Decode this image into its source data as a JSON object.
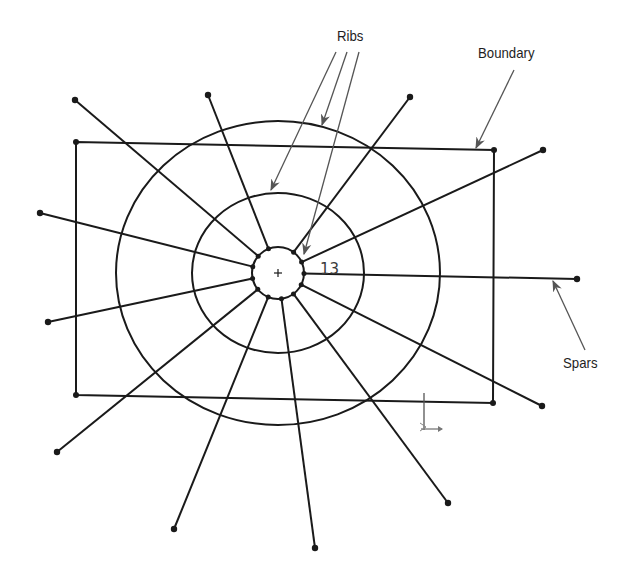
{
  "labels": {
    "ribs": "Ribs",
    "boundary": "Boundary",
    "spars": "Spars",
    "dimension": "13"
  },
  "colors": {
    "line": "#1a1a1a",
    "leader": "#555555",
    "text": "#1e1e1e"
  },
  "geometry": {
    "center": [
      278,
      273
    ],
    "circles": [
      {
        "name": "inner-rib",
        "rx": 26,
        "ry": 26
      },
      {
        "name": "middle-rib",
        "rx": 86,
        "ry": 80
      },
      {
        "name": "outer-rib",
        "rx": 162,
        "ry": 152
      }
    ],
    "boundary": [
      [
        76,
        142
      ],
      [
        494,
        150
      ],
      [
        493,
        403
      ],
      [
        76,
        395
      ]
    ],
    "spar_endpoints": [
      [
        75,
        100
      ],
      [
        208,
        95
      ],
      [
        410,
        97
      ],
      [
        543,
        150
      ],
      [
        577,
        279
      ],
      [
        542,
        406
      ],
      [
        448,
        503
      ],
      [
        315,
        548
      ],
      [
        174,
        529
      ],
      [
        57,
        452
      ],
      [
        48,
        322
      ],
      [
        40,
        213
      ]
    ]
  }
}
